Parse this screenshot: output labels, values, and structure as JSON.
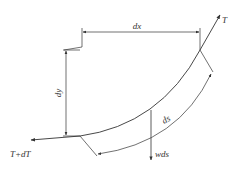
{
  "diagram": {
    "title": "",
    "labels": {
      "dx": "dx",
      "dy": "dy",
      "ds": "ds",
      "T": "T",
      "T_plus_dT": "T+dT",
      "wds": "wds"
    },
    "colors": {
      "line": "#333333",
      "background": "#ffffff"
    }
  }
}
